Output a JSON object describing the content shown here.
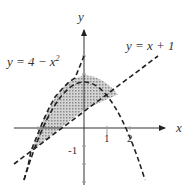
{
  "axes": {
    "x_label": "x",
    "y_label": "y",
    "x_ticks": [
      "1",
      "2"
    ],
    "y_ticks": [
      "-1"
    ]
  },
  "curves": {
    "parabola_label": "y = 4 − x",
    "parabola_exp": "2",
    "line_label": "y = x + 1"
  },
  "colors": {
    "stroke": "#222222",
    "shade": "#bdbdbd"
  }
}
